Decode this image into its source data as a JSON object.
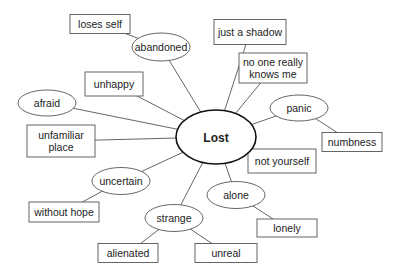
{
  "diagram": {
    "type": "mind-map",
    "center": {
      "id": "lost",
      "label": "Lost",
      "shape": "oval"
    },
    "nodes": [
      {
        "id": "loses_self",
        "lines": [
          "loses self"
        ],
        "shape": "box"
      },
      {
        "id": "abandoned",
        "lines": [
          "abandoned"
        ],
        "shape": "oval"
      },
      {
        "id": "just_a_shadow",
        "lines": [
          "just a shadow"
        ],
        "shape": "box"
      },
      {
        "id": "no_one_really_knows_me",
        "lines": [
          "no one really",
          "knows me"
        ],
        "shape": "box"
      },
      {
        "id": "unhappy",
        "lines": [
          "unhappy"
        ],
        "shape": "box"
      },
      {
        "id": "afraid",
        "lines": [
          "afraid"
        ],
        "shape": "oval"
      },
      {
        "id": "panic",
        "lines": [
          "panic"
        ],
        "shape": "oval"
      },
      {
        "id": "numbness",
        "lines": [
          "numbness"
        ],
        "shape": "box"
      },
      {
        "id": "unfamiliar_place",
        "lines": [
          "unfamiliar",
          "place"
        ],
        "shape": "box"
      },
      {
        "id": "not_yourself",
        "lines": [
          "not yourself"
        ],
        "shape": "box"
      },
      {
        "id": "uncertain",
        "lines": [
          "uncertain"
        ],
        "shape": "oval"
      },
      {
        "id": "alone",
        "lines": [
          "alone"
        ],
        "shape": "oval"
      },
      {
        "id": "without_hope",
        "lines": [
          "without hope"
        ],
        "shape": "box"
      },
      {
        "id": "lonely",
        "lines": [
          "lonely"
        ],
        "shape": "box"
      },
      {
        "id": "strange",
        "lines": [
          "strange"
        ],
        "shape": "oval"
      },
      {
        "id": "alienated",
        "lines": [
          "alienated"
        ],
        "shape": "box"
      },
      {
        "id": "unreal",
        "lines": [
          "unreal"
        ],
        "shape": "box"
      }
    ],
    "edges": [
      [
        "lost",
        "abandoned"
      ],
      [
        "abandoned",
        "loses_self"
      ],
      [
        "lost",
        "just_a_shadow"
      ],
      [
        "lost",
        "no_one_really_knows_me"
      ],
      [
        "lost",
        "unhappy"
      ],
      [
        "lost",
        "afraid"
      ],
      [
        "lost",
        "panic"
      ],
      [
        "panic",
        "numbness"
      ],
      [
        "lost",
        "unfamiliar_place"
      ],
      [
        "lost",
        "not_yourself"
      ],
      [
        "lost",
        "uncertain"
      ],
      [
        "uncertain",
        "without_hope"
      ],
      [
        "lost",
        "alone"
      ],
      [
        "alone",
        "lonely"
      ],
      [
        "lost",
        "strange"
      ],
      [
        "strange",
        "alienated"
      ],
      [
        "strange",
        "unreal"
      ]
    ]
  }
}
